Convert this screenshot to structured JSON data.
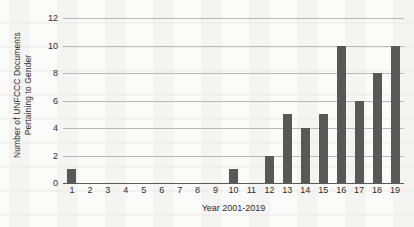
{
  "chart_data": {
    "type": "bar",
    "title": "",
    "subtitle": "",
    "xlabel": "Year 2001-2019",
    "ylabel": "Number of UNFCCC Documents Pertaining to Gender",
    "ylabel_lines": [
      "Number of UNFCCC Documents",
      "Pertaining to Gender"
    ],
    "categories": [
      "1",
      "2",
      "3",
      "4",
      "5",
      "6",
      "7",
      "8",
      "9",
      "10",
      "11",
      "12",
      "13",
      "14",
      "15",
      "16",
      "17",
      "18",
      "19"
    ],
    "values": [
      1,
      0,
      0,
      0,
      0,
      0,
      0,
      0,
      0,
      1,
      0,
      2,
      5,
      4,
      5,
      10,
      6,
      8,
      10
    ],
    "ylim": [
      0,
      12
    ],
    "y_ticks": [
      0,
      2,
      4,
      6,
      8,
      10,
      12
    ],
    "y_tick_labels": [
      "0",
      "2",
      "4",
      "6",
      "8",
      "10",
      "12"
    ],
    "grid": "horizontal",
    "legend": "none",
    "bar_color": "#585858",
    "gridline_color": "#b8b8b8",
    "axis_color": "#5a5a5a",
    "background_color": "#fbfbf9",
    "text_color": "#2b2b2b"
  }
}
